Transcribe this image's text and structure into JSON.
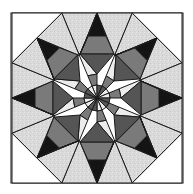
{
  "figure": {
    "title": "",
    "colors": {
      "background": "#ffffff",
      "frame": "#3a3a3a",
      "light_speckled": "#dcdcdc",
      "very_light": "#ececec",
      "mid_gray": "#7a7a7a",
      "dark_gray": "#555555",
      "black": "#141414",
      "line": "#1a1a1a"
    }
  }
}
